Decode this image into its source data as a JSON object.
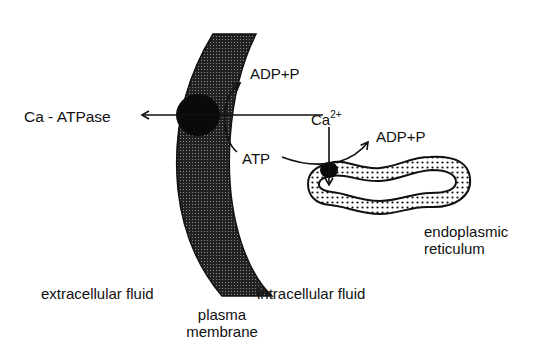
{
  "diagram": {
    "labels": {
      "ca_atpase": "Ca - ATPase",
      "adp_p_top": "ADP+P",
      "ca_ion": "Ca",
      "ca_charge": "2+",
      "atp": "ATP",
      "adp_p_er": "ADP+P",
      "er_line1": "endoplasmic",
      "er_line2": "reticulum",
      "extracellular": "extracellular fluid",
      "intracellular": "intracellular fluid",
      "membrane_line1": "plasma",
      "membrane_line2": "membrane"
    },
    "colors": {
      "ink": "#111111",
      "background": "#ffffff"
    }
  }
}
